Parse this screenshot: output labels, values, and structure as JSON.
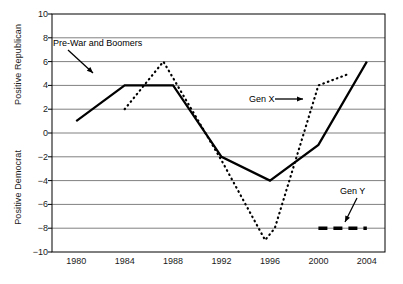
{
  "chart_data": {
    "type": "line",
    "title": "",
    "xlabel": "",
    "ylabel_top": "Positive Republican",
    "ylabel_bottom": "Positive Democrat",
    "x": [
      1980,
      1984,
      1988,
      1992,
      1996,
      2000,
      2004
    ],
    "xlim": [
      1978,
      2005.5
    ],
    "ylim": [
      -10,
      10
    ],
    "ytick_step": 2,
    "yticks": [
      10,
      8,
      6,
      4,
      2,
      0,
      -2,
      -4,
      -6,
      -8,
      -10
    ],
    "xticks": [
      "1980",
      "1984",
      "1988",
      "1992",
      "1996",
      "2000",
      "2004"
    ],
    "grid": "horizontal",
    "legend": "none",
    "series": [
      {
        "name": "Pre-War and Boomers",
        "style": "solid",
        "color": "#000000",
        "points": [
          {
            "x": 1980,
            "y": 1
          },
          {
            "x": 1984,
            "y": 4
          },
          {
            "x": 1988,
            "y": 4
          },
          {
            "x": 1992,
            "y": -2
          },
          {
            "x": 1996,
            "y": -4
          },
          {
            "x": 2000,
            "y": -1
          },
          {
            "x": 2004,
            "y": 6
          }
        ]
      },
      {
        "name": "Gen X",
        "style": "dotted",
        "color": "#000000",
        "points": [
          {
            "x": 1984,
            "y": 2
          },
          {
            "x": 1987.2,
            "y": 6
          },
          {
            "x": 1992,
            "y": -2.3
          },
          {
            "x": 1995.6,
            "y": -9
          },
          {
            "x": 1996.4,
            "y": -8
          },
          {
            "x": 2000,
            "y": 4
          },
          {
            "x": 2002.6,
            "y": 5
          }
        ]
      },
      {
        "name": "Gen Y",
        "style": "dashed-thick",
        "color": "#000000",
        "points": [
          {
            "x": 2000,
            "y": -8
          },
          {
            "x": 2004,
            "y": -8
          }
        ]
      }
    ],
    "annotations": [
      {
        "label": "Pre-War and Boomers",
        "arrow": "diagonal-down-right",
        "points_to_series": "Pre-War and Boomers"
      },
      {
        "label": "Gen X",
        "arrow": "right",
        "points_to_series": "Gen X"
      },
      {
        "label": "Gen Y",
        "arrow": "diagonal-down-left",
        "points_to_series": "Gen Y"
      }
    ]
  },
  "colors": {
    "plot_background": "#ffffff",
    "gridline": "#808080",
    "axis": "#000000",
    "series": "#000000",
    "text": "#1a1a1a"
  }
}
